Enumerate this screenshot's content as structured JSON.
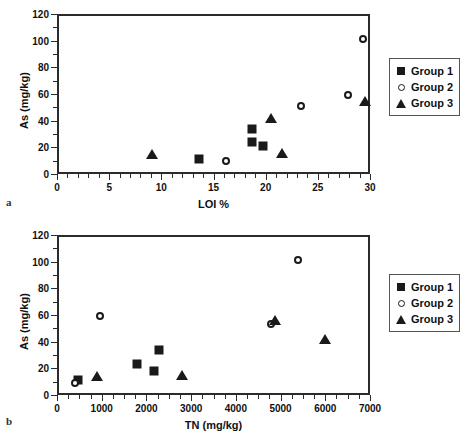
{
  "figure": {
    "panel_a_letter": "a",
    "panel_b_letter": "b"
  },
  "legend": {
    "items": [
      {
        "label": "Group 1",
        "marker": "square-marker"
      },
      {
        "label": "Group 2",
        "marker": "circle-marker"
      },
      {
        "label": "Group 3",
        "marker": "triangle-marker"
      }
    ]
  },
  "chart_data": [
    {
      "type": "scatter",
      "panel": "a",
      "title": "",
      "xlabel": "LOI %",
      "ylabel": "As  (mg/kg)",
      "xlim": [
        0,
        30
      ],
      "ylim": [
        0,
        120
      ],
      "xticks": [
        0,
        5,
        10,
        15,
        20,
        25,
        30
      ],
      "xticklabels": [
        "0",
        "5",
        "10",
        "15",
        "20",
        "25",
        "30"
      ],
      "yticks": [
        0,
        20,
        40,
        60,
        80,
        100,
        120
      ],
      "yticklabels": [
        "0",
        "20",
        "40",
        "60",
        "80",
        "100",
        "120"
      ],
      "x_minor_tick_step": 1,
      "y_minor_tick_step": 10,
      "grid": false,
      "legend_position": "right",
      "series": [
        {
          "name": "Group 1",
          "marker": "square",
          "points": [
            {
              "x": 13.6,
              "y": 11
            },
            {
              "x": 18.7,
              "y": 34
            },
            {
              "x": 18.7,
              "y": 24
            },
            {
              "x": 19.7,
              "y": 21
            }
          ]
        },
        {
          "name": "Group 2",
          "marker": "circle",
          "points": [
            {
              "x": 16.2,
              "y": 10
            },
            {
              "x": 23.4,
              "y": 51
            },
            {
              "x": 27.9,
              "y": 59
            },
            {
              "x": 29.3,
              "y": 101
            }
          ]
        },
        {
          "name": "Group 3",
          "marker": "triangle",
          "points": [
            {
              "x": 9.1,
              "y": 15
            },
            {
              "x": 20.5,
              "y": 42
            },
            {
              "x": 21.6,
              "y": 16
            },
            {
              "x": 29.5,
              "y": 55
            }
          ]
        }
      ]
    },
    {
      "type": "scatter",
      "panel": "b",
      "title": "",
      "xlabel": "TN  (mg/kg)",
      "ylabel": "As  (mg/kg)",
      "xlim": [
        0,
        7000
      ],
      "ylim": [
        0,
        120
      ],
      "xticks": [
        0,
        1000,
        2000,
        3000,
        4000,
        5000,
        6000,
        7000
      ],
      "xticklabels": [
        "0",
        "1000",
        "2000",
        "3000",
        "4000",
        "5000",
        "6000",
        "7000"
      ],
      "yticks": [
        0,
        20,
        40,
        60,
        80,
        100,
        120
      ],
      "yticklabels": [
        "0",
        "20",
        "40",
        "60",
        "80",
        "100",
        "120"
      ],
      "x_minor_tick_step": 250,
      "y_minor_tick_step": 10,
      "grid": false,
      "legend_position": "right",
      "series": [
        {
          "name": "Group 1",
          "marker": "square",
          "points": [
            {
              "x": 480,
              "y": 11
            },
            {
              "x": 1800,
              "y": 23
            },
            {
              "x": 2180,
              "y": 18
            },
            {
              "x": 2280,
              "y": 34
            }
          ]
        },
        {
          "name": "Group 2",
          "marker": "circle",
          "points": [
            {
              "x": 400,
              "y": 9
            },
            {
              "x": 960,
              "y": 59
            },
            {
              "x": 4790,
              "y": 53
            },
            {
              "x": 5380,
              "y": 101
            }
          ]
        },
        {
          "name": "Group 3",
          "marker": "triangle",
          "points": [
            {
              "x": 900,
              "y": 14
            },
            {
              "x": 2800,
              "y": 15
            },
            {
              "x": 4870,
              "y": 56
            },
            {
              "x": 6000,
              "y": 42
            }
          ]
        }
      ]
    }
  ]
}
